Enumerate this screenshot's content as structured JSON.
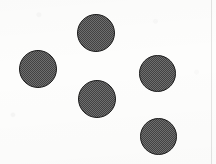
{
  "figure": {
    "background_color": "#fdfdfc",
    "canvas": {
      "width": 216,
      "height": 164
    },
    "marks": {
      "shape": "circle",
      "count": 5,
      "fill_style": "dithered-halftone-gray",
      "fill_color": "#6e6e6e",
      "outline_color": "#1c1c1c",
      "outline_width": 1.4,
      "diameter": 38
    },
    "edge_line": {
      "name": "right-scan-edge",
      "x": 211,
      "color": "#1a1a1a",
      "opacity": 0.1
    },
    "circles": [
      {
        "id": "circle-top",
        "label": "top circle",
        "cx": 96,
        "cy": 33,
        "d": 38,
        "left": 77,
        "top": 14
      },
      {
        "id": "circle-left",
        "label": "left circle",
        "cx": 38,
        "cy": 69,
        "d": 38,
        "left": 19,
        "top": 50
      },
      {
        "id": "circle-right",
        "label": "right circle",
        "cx": 157,
        "cy": 74,
        "d": 37,
        "left": 139,
        "top": 55
      },
      {
        "id": "circle-center",
        "label": "center circle",
        "cx": 97,
        "cy": 99,
        "d": 38,
        "left": 78,
        "top": 80
      },
      {
        "id": "circle-bottom-right",
        "label": "bottom right circle",
        "cx": 158,
        "cy": 137,
        "d": 37,
        "left": 140,
        "top": 118
      }
    ]
  }
}
